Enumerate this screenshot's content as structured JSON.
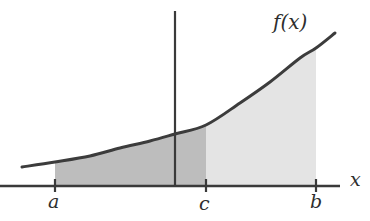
{
  "figure": {
    "background_color": "#ffffff",
    "width": 370,
    "height": 221,
    "curve_color": "#3c3c3c",
    "axis_color": "#3a3a3a",
    "label_color": "#2e2e2e",
    "region_left_color": "#bdbdbd",
    "region_right_color": "#e4e4e4"
  },
  "labels": {
    "function_label": "f(x)",
    "x_axis_label": "x",
    "tick_a": "a",
    "tick_c": "c",
    "tick_b": "b"
  },
  "chart_data": {
    "type": "area",
    "title": "",
    "subtitle": "",
    "xlabel": "x",
    "ylabel": "",
    "grid": false,
    "legend": null,
    "annotations": [
      {
        "text": "f(x)",
        "x": 316,
        "y": 44,
        "role": "curve-label"
      }
    ],
    "axes": {
      "x_axis": {
        "y_pixel": 186,
        "x_start_pixel": 0,
        "x_end_pixel": 340,
        "has_arrow": false
      },
      "y_axis": {
        "x_pixel": 175,
        "y_top_pixel": 11,
        "y_bottom_pixel": 186,
        "has_arrow": false
      }
    },
    "ticks": [
      {
        "label": "a",
        "x_pixel": 55
      },
      {
        "label": "c",
        "x_pixel": 206
      },
      {
        "label": "b",
        "x_pixel": 316
      }
    ],
    "series": [
      {
        "name": "f(x)",
        "type": "line",
        "points_pixel": [
          [
            22,
            167
          ],
          [
            55,
            162
          ],
          [
            90,
            156
          ],
          [
            120,
            148
          ],
          [
            150,
            141
          ],
          [
            175,
            134
          ],
          [
            206,
            125
          ],
          [
            240,
            103
          ],
          [
            270,
            82
          ],
          [
            300,
            58
          ],
          [
            316,
            48
          ],
          [
            335,
            33
          ]
        ]
      }
    ],
    "shaded_regions": [
      {
        "name": "region-a-to-c",
        "from": "a",
        "to": "c",
        "x_from_pixel": 55,
        "x_to_pixel": 206,
        "fill": "#bdbdbd",
        "meaning": "integral from a to c"
      },
      {
        "name": "region-c-to-b",
        "from": "c",
        "to": "b",
        "x_from_pixel": 206,
        "x_to_pixel": 316,
        "fill": "#e4e4e4",
        "meaning": "integral from c to b"
      }
    ]
  }
}
